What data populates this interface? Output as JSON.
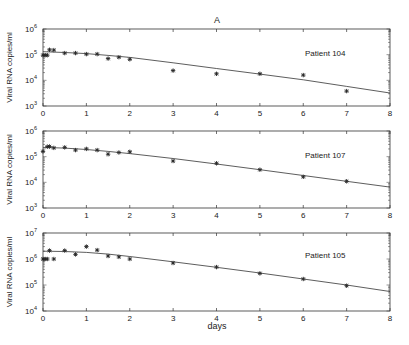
{
  "figure": {
    "title": "A",
    "xlabel": "days"
  },
  "chart_data": [
    {
      "type": "scatter",
      "title": "A",
      "annotation": "Patient 104",
      "xlabel": "",
      "ylabel": "Viral RNA copies/ml",
      "xlim": [
        0,
        8
      ],
      "ylim": [
        1000,
        1000000
      ],
      "yscale": "log",
      "x_ticks": [
        0,
        1,
        2,
        3,
        4,
        5,
        6,
        7,
        8
      ],
      "y_tick_labels": [
        {
          "base": "10",
          "exp": "3",
          "value": 1000
        },
        {
          "base": "10",
          "exp": "4",
          "value": 10000
        },
        {
          "base": "10",
          "exp": "5",
          "value": 100000
        },
        {
          "base": "10",
          "exp": "6",
          "value": 1000000
        }
      ],
      "series": [
        {
          "name": "observed",
          "marker": "asterisk",
          "x": [
            0,
            0.05,
            0.1,
            0.15,
            0.25,
            0.5,
            0.75,
            1.0,
            1.25,
            1.5,
            1.75,
            2.0,
            3,
            4,
            5,
            6,
            7
          ],
          "y": [
            95000,
            95000,
            95000,
            155000,
            150000,
            115000,
            115000,
            105000,
            105000,
            70000,
            80000,
            66000,
            24000,
            18000,
            18000,
            16000,
            3800
          ]
        },
        {
          "name": "model fit",
          "line": true,
          "x": [
            0,
            0.5,
            1,
            1.5,
            2,
            3,
            4,
            5,
            6,
            7,
            8
          ],
          "y": [
            130000,
            122000,
            110000,
            94000,
            78000,
            48000,
            29000,
            17500,
            10500,
            5800,
            3200
          ]
        }
      ]
    },
    {
      "type": "scatter",
      "annotation": "Patient 107",
      "xlabel": "",
      "ylabel": "Viral RNA copies/ml",
      "xlim": [
        0,
        8
      ],
      "ylim": [
        1000,
        1000000
      ],
      "yscale": "log",
      "x_ticks": [
        0,
        1,
        2,
        3,
        4,
        5,
        6,
        7,
        8
      ],
      "y_tick_labels": [
        {
          "base": "10",
          "exp": "3",
          "value": 1000
        },
        {
          "base": "10",
          "exp": "4",
          "value": 10000
        },
        {
          "base": "10",
          "exp": "5",
          "value": 100000
        },
        {
          "base": "10",
          "exp": "6",
          "value": 1000000
        }
      ],
      "series": [
        {
          "name": "observed",
          "marker": "asterisk",
          "x": [
            0,
            0.1,
            0.15,
            0.25,
            0.5,
            0.75,
            1.0,
            1.25,
            1.5,
            1.75,
            2.0,
            3,
            4,
            5,
            6,
            7
          ],
          "y": [
            160000,
            245000,
            250000,
            220000,
            230000,
            180000,
            200000,
            180000,
            125000,
            145000,
            155000,
            68000,
            55000,
            31000,
            16500,
            11000
          ]
        },
        {
          "name": "model fit",
          "line": true,
          "x": [
            0,
            0.5,
            1,
            1.5,
            2,
            3,
            4,
            5,
            6,
            7,
            8
          ],
          "y": [
            230000,
            215000,
            190000,
            160000,
            132000,
            85000,
            52000,
            31000,
            18500,
            11000,
            6500
          ]
        }
      ]
    },
    {
      "type": "scatter",
      "annotation": "Patient 105",
      "xlabel": "days",
      "ylabel": "Viral RNA copies/ml",
      "xlim": [
        0,
        8
      ],
      "ylim": [
        10000,
        10000000
      ],
      "yscale": "log",
      "x_ticks": [
        0,
        1,
        2,
        3,
        4,
        5,
        6,
        7,
        8
      ],
      "y_tick_labels": [
        {
          "base": "10",
          "exp": "4",
          "value": 10000
        },
        {
          "base": "10",
          "exp": "5",
          "value": 100000
        },
        {
          "base": "10",
          "exp": "6",
          "value": 1000000
        },
        {
          "base": "10",
          "exp": "7",
          "value": 10000000
        }
      ],
      "series": [
        {
          "name": "observed",
          "marker": "asterisk",
          "x": [
            0,
            0.05,
            0.1,
            0.15,
            0.25,
            0.5,
            0.75,
            1.0,
            1.25,
            1.5,
            1.75,
            2.0,
            3,
            4,
            5,
            6,
            7
          ],
          "y": [
            1000000,
            1000000,
            1000000,
            2100000,
            1000000,
            2100000,
            1500000,
            3000000,
            2200000,
            1300000,
            1200000,
            1000000,
            700000,
            490000,
            280000,
            170000,
            94000
          ]
        },
        {
          "name": "model fit",
          "line": true,
          "x": [
            0,
            0.5,
            1,
            1.5,
            2,
            3,
            4,
            5,
            6,
            7,
            8
          ],
          "y": [
            2000000,
            1950000,
            1800000,
            1550000,
            1250000,
            780000,
            480000,
            290000,
            170000,
            100000,
            56000
          ]
        }
      ]
    }
  ]
}
